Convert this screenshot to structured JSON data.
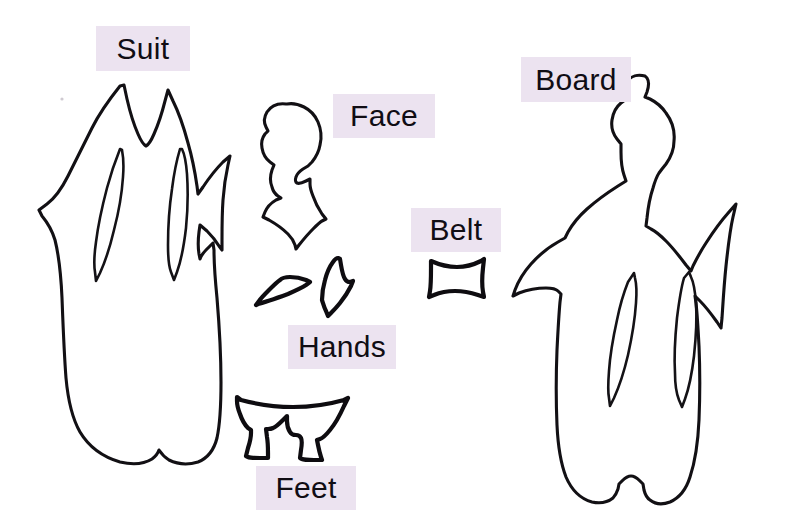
{
  "page": {
    "background_color": "#ffffff",
    "ink_color": "#121014",
    "label_background_color": "#ece3f0",
    "label_text_color": "#100d14",
    "width": 811,
    "height": 530
  },
  "labels": [
    {
      "id": "suit",
      "text": "Suit",
      "x": 96,
      "y": 26,
      "width": 94,
      "height": 45,
      "font_size": 30
    },
    {
      "id": "face",
      "text": "Face",
      "x": 333,
      "y": 94,
      "width": 102,
      "height": 44,
      "font_size": 30
    },
    {
      "id": "board",
      "text": "Board",
      "x": 521,
      "y": 57,
      "width": 110,
      "height": 45,
      "font_size": 30
    },
    {
      "id": "belt",
      "text": "Belt",
      "x": 411,
      "y": 208,
      "width": 90,
      "height": 44,
      "font_size": 30
    },
    {
      "id": "hands",
      "text": "Hands",
      "x": 288,
      "y": 325,
      "width": 108,
      "height": 44,
      "font_size": 30
    },
    {
      "id": "feet",
      "text": "Feet",
      "x": 256,
      "y": 466,
      "width": 100,
      "height": 44,
      "font_size": 30
    }
  ],
  "pattern_pieces": [
    {
      "id": "suit",
      "name": "suit-pattern-piece",
      "label": "Suit",
      "description": "Large flame-collared robe body with two almond sleeve slits and notched hem",
      "bounds": {
        "x": 38,
        "y": 83,
        "width": 190,
        "height": 383
      }
    },
    {
      "id": "face",
      "name": "face-pattern-piece",
      "label": "Face",
      "description": "Profile head silhouette facing right with hair bun and pointed neck collar",
      "bounds": {
        "x": 262,
        "y": 101,
        "width": 66,
        "height": 122
      }
    },
    {
      "id": "hands",
      "name": "hands-pattern-piece",
      "label": "Hands",
      "description": "Two small hand shapes: a tapered wedge and a curved angled sliver",
      "bounds": {
        "x": 255,
        "y": 258,
        "width": 100,
        "height": 62
      }
    },
    {
      "id": "feet",
      "name": "feet-pattern-piece",
      "label": "Feet",
      "description": "Wide arched skirt hem with two downward foot tabs",
      "bounds": {
        "x": 238,
        "y": 394,
        "width": 110,
        "height": 67
      }
    },
    {
      "id": "belt",
      "name": "belt-pattern-piece",
      "label": "Belt",
      "description": "Small curved trapezoid belt band",
      "bounds": {
        "x": 428,
        "y": 255,
        "width": 56,
        "height": 42
      }
    },
    {
      "id": "board",
      "name": "board-pattern-piece",
      "label": "Board",
      "description": "Full standing figure silhouette with raised right arm, two almond slits and two foot tabs",
      "bounds": {
        "x": 531,
        "y": 68,
        "width": 228,
        "height": 434
      }
    }
  ]
}
